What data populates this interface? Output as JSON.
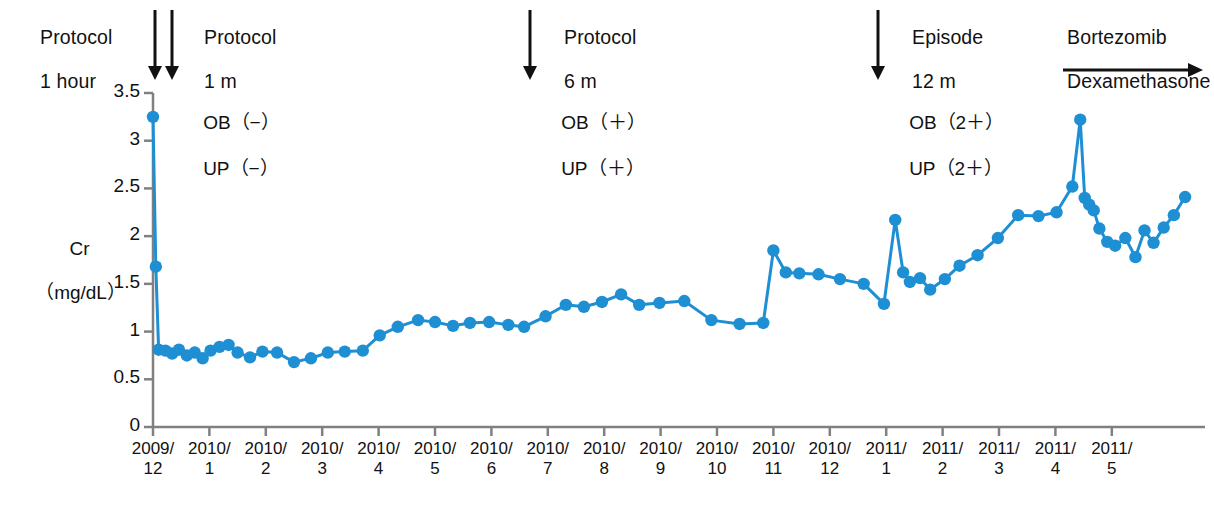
{
  "figure": {
    "title": "",
    "background": "#ffffff",
    "series_color": "#1f8fd4",
    "axis_color": "#808080",
    "text_color": "#111111"
  },
  "annotations": [
    {
      "id": "protocol-1-hour",
      "line1": "Protocol",
      "line2": "1 hour",
      "x": 18,
      "y": 4,
      "arrow": "double-down",
      "arrow_x": [
        155,
        172
      ],
      "arrow_y0": 10,
      "arrow_y1": 80
    },
    {
      "id": "protocol-1-m",
      "line1": "Protocol",
      "line2": "1 m",
      "x": 182,
      "y": 4,
      "arrow": "none"
    },
    {
      "id": "protocol-6-m",
      "line1": "Protocol",
      "line2": "6 m",
      "x": 542,
      "y": 4,
      "arrow": "down",
      "arrow_x": [
        530
      ],
      "arrow_y0": 10,
      "arrow_y1": 80
    },
    {
      "id": "episode-12-m",
      "line1": "Episode",
      "line2": "12 m",
      "x": 890,
      "y": 4,
      "arrow": "down",
      "arrow_x": [
        878
      ],
      "arrow_y0": 10,
      "arrow_y1": 80
    },
    {
      "id": "bortezomib-dexamethasone",
      "line1": "Bortezomib",
      "line2": "Dexamethasone",
      "x": 1045,
      "y": 4,
      "arrow": "right",
      "arrow_x0": 1063,
      "arrow_x1": 1203,
      "arrow_y": 70
    }
  ],
  "status_markers": [
    {
      "id": "status-baseline",
      "ob": "OB（−）",
      "up": "UP（−）",
      "x": 182,
      "y": 88
    },
    {
      "id": "status-6m",
      "ob": "OB（＋）",
      "up": "UP（＋）",
      "x": 540,
      "y": 88
    },
    {
      "id": "status-12m",
      "ob": "OB（2＋）",
      "up": "UP（2＋）",
      "x": 888,
      "y": 88
    }
  ],
  "chart_data": {
    "type": "line",
    "title": "",
    "xlabel": "",
    "ylabel": "Cr\n（mg/dL）",
    "ylabel_line1": "Cr",
    "ylabel_line2": "（mg/dL）",
    "ylim": [
      0,
      3.5
    ],
    "yticks": [
      0,
      0.5,
      1,
      1.5,
      2,
      2.5,
      3,
      3.5
    ],
    "ytick_labels": [
      "0",
      "0.5",
      "1",
      "1.5",
      "2",
      "2.5",
      "3",
      "3.5"
    ],
    "grid": false,
    "legend": null,
    "marker": "circle",
    "xtick_labels": [
      {
        "l1": "2009/",
        "l2": "12"
      },
      {
        "l1": "2010/",
        "l2": "1"
      },
      {
        "l1": "2010/",
        "l2": "2"
      },
      {
        "l1": "2010/",
        "l2": "3"
      },
      {
        "l1": "2010/",
        "l2": "4"
      },
      {
        "l1": "2010/",
        "l2": "5"
      },
      {
        "l1": "2010/",
        "l2": "6"
      },
      {
        "l1": "2010/",
        "l2": "7"
      },
      {
        "l1": "2010/",
        "l2": "8"
      },
      {
        "l1": "2010/",
        "l2": "9"
      },
      {
        "l1": "2010/",
        "l2": "10"
      },
      {
        "l1": "2010/",
        "l2": "11"
      },
      {
        "l1": "2010/",
        "l2": "12"
      },
      {
        "l1": "2011/",
        "l2": "1"
      },
      {
        "l1": "2011/",
        "l2": "2"
      },
      {
        "l1": "2011/",
        "l2": "3"
      },
      {
        "l1": "2011/",
        "l2": "4"
      },
      {
        "l1": "2011/",
        "l2": "5"
      }
    ],
    "xlim_months": [
      0,
      18.6
    ],
    "series": [
      {
        "name": "Cr",
        "unit": "mg/dL",
        "color": "#1f8fd4",
        "x": [
          0.0,
          0.05,
          0.1,
          0.22,
          0.34,
          0.46,
          0.6,
          0.74,
          0.88,
          1.02,
          1.18,
          1.34,
          1.5,
          1.72,
          1.94,
          2.2,
          2.5,
          2.8,
          3.1,
          3.4,
          3.72,
          4.02,
          4.34,
          4.7,
          5.0,
          5.32,
          5.62,
          5.96,
          6.3,
          6.58,
          6.96,
          7.32,
          7.64,
          7.96,
          8.3,
          8.62,
          8.98,
          9.42,
          9.9,
          10.4,
          10.82,
          11.0,
          11.22,
          11.46,
          11.8,
          12.18,
          12.6,
          12.96,
          13.16,
          13.3,
          13.42,
          13.6,
          13.78,
          14.04,
          14.3,
          14.62,
          14.98,
          15.34,
          15.7,
          16.02,
          16.3,
          16.44,
          16.52,
          16.6,
          16.68,
          16.78,
          16.92,
          17.06,
          17.24,
          17.42,
          17.58,
          17.74,
          17.92,
          18.1,
          18.3
        ],
        "y": [
          3.25,
          1.68,
          0.81,
          0.8,
          0.77,
          0.81,
          0.75,
          0.78,
          0.72,
          0.8,
          0.84,
          0.86,
          0.78,
          0.73,
          0.79,
          0.78,
          0.68,
          0.72,
          0.78,
          0.79,
          0.8,
          0.96,
          1.05,
          1.12,
          1.1,
          1.06,
          1.09,
          1.1,
          1.07,
          1.05,
          1.16,
          1.28,
          1.26,
          1.31,
          1.39,
          1.28,
          1.3,
          1.32,
          1.12,
          1.08,
          1.09,
          1.85,
          1.62,
          1.61,
          1.6,
          1.55,
          1.5,
          1.29,
          2.17,
          1.62,
          1.52,
          1.56,
          1.44,
          1.55,
          1.69,
          1.8,
          1.98,
          2.22,
          2.21,
          2.25,
          2.52,
          3.22,
          2.4,
          2.33,
          2.27,
          2.08,
          1.94,
          1.9,
          1.98,
          1.78,
          2.06,
          1.93,
          2.09,
          2.22,
          2.41
        ]
      }
    ]
  },
  "plot_geometry": {
    "left": 153,
    "right": 1205,
    "top": 93,
    "bottom": 427,
    "tick_spacing": 56.4
  }
}
